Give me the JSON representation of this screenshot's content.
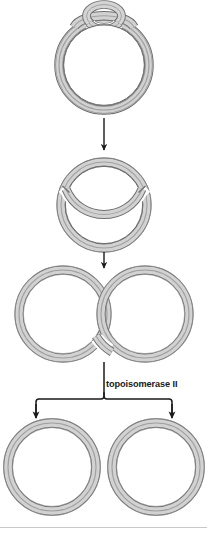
{
  "figure": {
    "background_color": "#ffffff",
    "stages": [
      {
        "id": "stage-1",
        "name": "supercoiled-circle-with-loop",
        "description": "closed circular DNA duplex with a small crossed loop at the top",
        "center_x": 104,
        "center_y": 64,
        "radius": 45
      },
      {
        "id": "stage-2",
        "name": "circle-with-strand-passing-through",
        "description": "circular DNA with one duplex segment passed through a transient double-strand break",
        "center_x": 104,
        "center_y": 205,
        "radius": 43
      },
      {
        "id": "stage-3",
        "name": "catenated-rings",
        "description": "two interlocked (catenated) DNA circles",
        "left_center_x": 63,
        "right_center_x": 145,
        "center_y": 314,
        "radius": 44
      },
      {
        "id": "stage-4",
        "name": "decatenated-rings",
        "description": "two separate (decatenated) DNA circles",
        "left_center_x": 52,
        "right_center_x": 155,
        "center_y": 467,
        "radius": 46
      }
    ],
    "arrows": [
      {
        "id": "arrow-1",
        "name": "arrow-stage1-to-stage2",
        "from_y": 118,
        "to_y": 152
      },
      {
        "id": "arrow-2",
        "name": "arrow-stage2-to-stage3",
        "from_y": 251,
        "to_y": 268
      },
      {
        "id": "arrow-3",
        "name": "branching-arrow-stage3-to-stage4",
        "from_y": 362,
        "to_y": 418,
        "branches": 2
      }
    ],
    "labels": {
      "enzyme": "topoisomerase II"
    },
    "caption_cut_off": "",
    "colors": {
      "duplex_fill": "#cfcfcf",
      "duplex_fill_light": "#e2e2e2",
      "duplex_outline": "#6e6e6e",
      "duplex_midline": "#9a9a9a",
      "arrow": "#1a1a1a",
      "label_text": "#1a1a1a",
      "rule": "#c8c8c8"
    }
  }
}
